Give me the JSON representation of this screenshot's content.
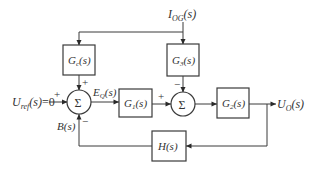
{
  "diagram": {
    "type": "control-loop block diagram",
    "input_signal": {
      "name": "U",
      "sub": "ref",
      "arg": "(s)",
      "suffix": "=0"
    },
    "disturbance_signal": {
      "name": "I",
      "sub": "OG",
      "arg": "(s)"
    },
    "error_signal": {
      "name": "E",
      "sub": "Q",
      "arg": "(s)"
    },
    "feedback_signal": {
      "name": "B",
      "arg": "(s)"
    },
    "output_signal": {
      "name": "U",
      "sub": "O",
      "arg": "(s)"
    },
    "blocks": [
      {
        "id": "Gc",
        "name": "G",
        "sub": "c",
        "arg": "(s)"
      },
      {
        "id": "G3",
        "name": "G",
        "sub": "3",
        "arg": "(s)"
      },
      {
        "id": "G1",
        "name": "G",
        "sub": "1",
        "arg": "(s)"
      },
      {
        "id": "G2",
        "name": "G",
        "sub": "2",
        "arg": "(s)"
      },
      {
        "id": "H",
        "name": "H",
        "arg": "(s)"
      }
    ],
    "summing_junctions": [
      {
        "id": "sum1",
        "symbol": "Σ",
        "signs": {
          "left": "+",
          "top": "+",
          "bottom": "−"
        }
      },
      {
        "id": "sum2",
        "symbol": "Σ",
        "signs": {
          "left": "+",
          "top": "−"
        }
      }
    ]
  }
}
